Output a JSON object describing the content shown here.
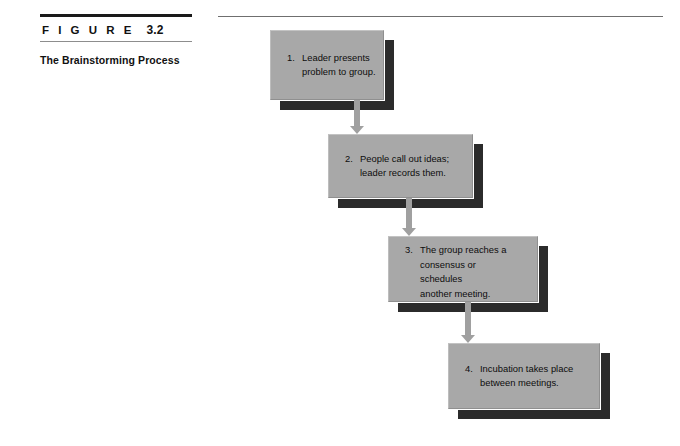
{
  "figure": {
    "label_word": "F I G U R E",
    "number": "3.2",
    "title": "The Brainstorming\nProcess"
  },
  "colors": {
    "box_fill": "#a8a8a8",
    "box_shadow": "#2b2b2b",
    "arrow": "#a0a0a0",
    "rule_dark": "#1a1a1a",
    "rule_light": "#8d8d8d",
    "text": "#0d0d0d"
  },
  "flow": {
    "type": "vertical-cascade-flowchart",
    "steps": [
      {
        "number": "1.",
        "lines": [
          "Leader presents",
          "problem to group."
        ],
        "box": {
          "x": 270,
          "y": 30,
          "w": 114,
          "h": 70
        }
      },
      {
        "number": "2.",
        "lines": [
          "People call out ideas;",
          "leader records them."
        ],
        "box": {
          "x": 328,
          "y": 134,
          "w": 145,
          "h": 64
        }
      },
      {
        "number": "3.",
        "lines": [
          "The group reaches a",
          "consensus or",
          "schedules",
          "another meeting."
        ],
        "box": {
          "x": 388,
          "y": 236,
          "w": 150,
          "h": 66
        }
      },
      {
        "number": "4.",
        "lines": [
          "Incubation takes place",
          "between meetings."
        ],
        "box": {
          "x": 448,
          "y": 343,
          "w": 152,
          "h": 66
        }
      }
    ],
    "arrows": [
      {
        "name": "arrow-step1-to-step2",
        "x": 348,
        "y": 100,
        "length": 34
      },
      {
        "name": "arrow-step2-to-step3",
        "x": 400,
        "y": 198,
        "length": 38
      },
      {
        "name": "arrow-step3-to-step4",
        "x": 459,
        "y": 302,
        "length": 41
      }
    ]
  }
}
